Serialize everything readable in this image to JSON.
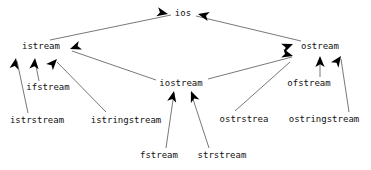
{
  "diagram": {
    "type": "inheritance-hierarchy",
    "background_color": "#ffffff",
    "line_color": "#555555",
    "arrow_color": "#000000",
    "text_color": "#111111",
    "nodes": [
      {
        "id": "ios",
        "label": "ios",
        "x": 183,
        "y": 13
      },
      {
        "id": "istream",
        "label": "istream",
        "x": 41,
        "y": 46
      },
      {
        "id": "ostream",
        "label": "ostream",
        "x": 320,
        "y": 46
      },
      {
        "id": "iostream",
        "label": "iostream",
        "x": 181,
        "y": 83
      },
      {
        "id": "ifstream",
        "label": "ifstream",
        "x": 48,
        "y": 87
      },
      {
        "id": "ofstream",
        "label": "ofstream",
        "x": 309,
        "y": 83
      },
      {
        "id": "istrstream",
        "label": "istrstream",
        "x": 37,
        "y": 120
      },
      {
        "id": "istringstream",
        "label": "istringstream",
        "x": 126,
        "y": 120
      },
      {
        "id": "ostrstrea",
        "label": "ostrstrea",
        "x": 244,
        "y": 119
      },
      {
        "id": "ostringstream",
        "label": "ostringstream",
        "x": 324,
        "y": 119
      },
      {
        "id": "fstream",
        "label": "fstream",
        "x": 159,
        "y": 155
      },
      {
        "id": "strstream",
        "label": "strstream",
        "x": 222,
        "y": 155
      }
    ],
    "edges": [
      {
        "from": "istream",
        "to": "ios",
        "x1": 50,
        "y1": 40,
        "x2": 171,
        "y2": 15
      },
      {
        "from": "ostream",
        "to": "ios",
        "x1": 301,
        "y1": 41,
        "x2": 196,
        "y2": 16
      },
      {
        "from": "istrstream",
        "to": "istream",
        "x1": 28,
        "y1": 113,
        "x2": 17,
        "y2": 61
      },
      {
        "from": "ifstream",
        "to": "istream",
        "x1": 39,
        "y1": 81,
        "x2": 35,
        "y2": 61
      },
      {
        "from": "istringstream",
        "to": "istream",
        "x1": 106,
        "y1": 112,
        "x2": 57,
        "y2": 62
      },
      {
        "from": "iostream",
        "to": "istream",
        "x1": 156,
        "y1": 80,
        "x2": 72,
        "y2": 51
      },
      {
        "from": "iostream",
        "to": "ostream",
        "x1": 208,
        "y1": 79,
        "x2": 292,
        "y2": 57
      },
      {
        "from": "ostrstrea",
        "to": "ostream",
        "x1": 235,
        "y1": 111,
        "x2": 290,
        "y2": 62
      },
      {
        "from": "ofstream",
        "to": "ostream",
        "x1": 320,
        "y1": 77,
        "x2": 320,
        "y2": 59
      },
      {
        "from": "ostringstream",
        "to": "ostream",
        "x1": 349,
        "y1": 112,
        "x2": 341,
        "y2": 59
      },
      {
        "from": "fstream",
        "to": "iostream",
        "x1": 166,
        "y1": 148,
        "x2": 174,
        "y2": 93
      },
      {
        "from": "strstream",
        "to": "iostream",
        "x1": 209,
        "y1": 148,
        "x2": 191,
        "y2": 93
      }
    ],
    "arrowheads": [
      {
        "target": "ios",
        "x": 168,
        "y": 14,
        "angle": 12
      },
      {
        "target": "ios",
        "x": 198,
        "y": 14,
        "angle": 193
      },
      {
        "target": "istream",
        "x": 16,
        "y": 58,
        "angle": -80
      },
      {
        "target": "istream",
        "x": 35,
        "y": 58,
        "angle": -85
      },
      {
        "target": "istream",
        "x": 57,
        "y": 59,
        "angle": -47
      },
      {
        "target": "istream",
        "x": 70,
        "y": 49,
        "angle": 160
      },
      {
        "target": "ostream",
        "x": 293,
        "y": 44,
        "angle": -22
      },
      {
        "target": "ostream",
        "x": 293,
        "y": 56,
        "angle": 15
      },
      {
        "target": "ostream",
        "x": 320,
        "y": 56,
        "angle": -90
      },
      {
        "target": "ostream",
        "x": 341,
        "y": 56,
        "angle": -55
      },
      {
        "target": "iostream",
        "x": 174,
        "y": 91,
        "angle": -78
      },
      {
        "target": "iostream",
        "x": 191,
        "y": 91,
        "angle": -112
      }
    ]
  }
}
